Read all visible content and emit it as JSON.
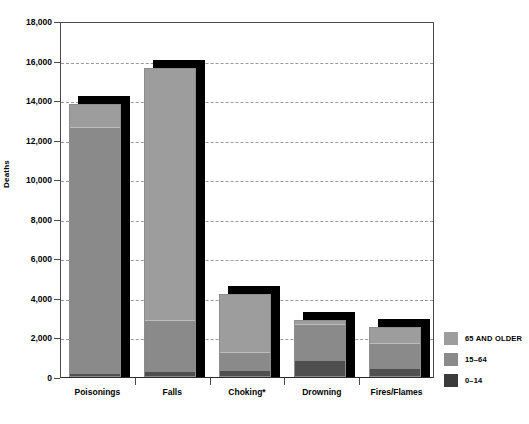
{
  "chart_data": {
    "type": "bar",
    "subtype": "stacked-bar",
    "title": "",
    "xlabel": "",
    "ylabel": "Deaths",
    "ylim": [
      0,
      18000
    ],
    "ytick_step": 2000,
    "ytick_labels": [
      "0",
      "2,000",
      "4,000",
      "6,000",
      "8,000",
      "10,000",
      "12,000",
      "14,000",
      "16,000",
      "18,000"
    ],
    "grid": true,
    "legend_position": "right-bottom",
    "categories": [
      "Poisonings",
      "Falls",
      "Choking*",
      "Drowning",
      "Fires/Flames"
    ],
    "series": [
      {
        "name": "0–14",
        "color": "#4f4f4f",
        "values": [
          100,
          200,
          250,
          800,
          400
        ]
      },
      {
        "name": "15–64",
        "color": "#8a8a8a",
        "values": [
          12600,
          2600,
          950,
          1900,
          1300
        ]
      },
      {
        "name": "65 AND OLDER",
        "color": "#9d9d9d",
        "values": [
          1100,
          12800,
          3000,
          200,
          850
        ]
      }
    ],
    "totals": [
      13800,
      15600,
      4200,
      2900,
      2550
    ]
  },
  "axis": {
    "y_title": "Deaths"
  },
  "legend": {
    "items": [
      {
        "label": "65 AND OLDER",
        "swatch": "light-gray-swatch"
      },
      {
        "label": "15–64",
        "swatch": "medium-gray-swatch"
      },
      {
        "label": "0–14",
        "swatch": "dark-gray-swatch"
      }
    ]
  }
}
